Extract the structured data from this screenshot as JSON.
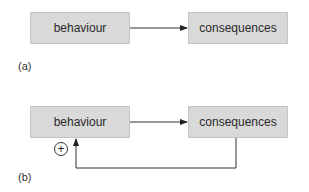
{
  "panel_a": {
    "label": "(a)",
    "nodes": [
      {
        "id": "behaviour",
        "text": "behaviour"
      },
      {
        "id": "consequences",
        "text": "consequences"
      }
    ],
    "edges": [
      {
        "from": "behaviour",
        "to": "consequences"
      }
    ]
  },
  "panel_b": {
    "label": "(b)",
    "nodes": [
      {
        "id": "behaviour",
        "text": "behaviour"
      },
      {
        "id": "consequences",
        "text": "consequences"
      }
    ],
    "edges": [
      {
        "from": "behaviour",
        "to": "consequences"
      },
      {
        "from": "consequences",
        "to": "behaviour",
        "type": "feedback",
        "sign": "+"
      }
    ],
    "feedback_sign": "+"
  },
  "colors": {
    "box_fill": "#d9d9d9",
    "box_border": "#c4c4c4",
    "line": "#333333"
  }
}
